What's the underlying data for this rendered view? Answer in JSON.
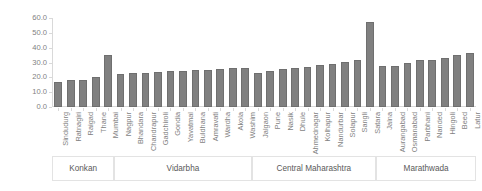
{
  "chart_data": {
    "type": "bar",
    "title": "",
    "xlabel": "",
    "ylabel": "CoV (%)",
    "ylim": [
      0,
      60
    ],
    "yticks": [
      "0.0",
      "10.0",
      "20.0",
      "30.0",
      "40.0",
      "50.0",
      "60.0"
    ],
    "ytick_values": [
      0,
      10,
      20,
      30,
      40,
      50,
      60
    ],
    "grid": false,
    "legend": "none",
    "bar_color": "#808080",
    "categories": [
      "Sindudurg",
      "Ratnagiri",
      "Raigad",
      "Thane",
      "Mumbai",
      "Nagpur",
      "Bhandara",
      "Chandrapur",
      "Gadchiroli",
      "Gondia",
      "Yavatmal",
      "Buldhana",
      "Amravati",
      "Wardha",
      "Akola",
      "Washim",
      "Jalgaon",
      "Pune",
      "Nasik",
      "Dhule",
      "Ahmednagar",
      "Kolhapur",
      "Nandurbar",
      "Solapur",
      "Sangli",
      "Satara",
      "Jalna",
      "Aurangabad",
      "Osmanabad",
      "Parbhani",
      "Nanded",
      "Hingoli",
      "Beed",
      "Latur"
    ],
    "values": [
      17.0,
      18.0,
      18.3,
      20.2,
      35.2,
      22.2,
      22.6,
      23.0,
      23.6,
      24.0,
      24.4,
      24.8,
      25.2,
      25.6,
      26.0,
      26.4,
      23.2,
      24.6,
      25.4,
      26.2,
      27.2,
      28.0,
      28.8,
      30.2,
      31.8,
      57.5,
      27.4,
      27.6,
      29.6,
      31.4,
      32.0,
      33.2,
      35.4,
      36.6
    ],
    "groups": [
      {
        "label": "Konkan",
        "count": 5
      },
      {
        "label": "Vidarbha",
        "count": 11
      },
      {
        "label": "Central Maharashtra",
        "count": 10
      },
      {
        "label": "Marathwada",
        "count": 8
      }
    ]
  }
}
